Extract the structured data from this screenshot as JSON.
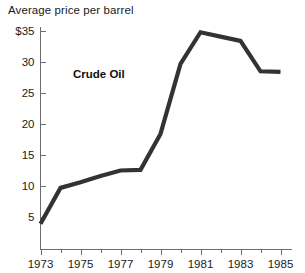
{
  "figure": {
    "title": "Average price per barrel",
    "background_color": "#ffffff"
  },
  "annotation": {
    "label": "Crude Oil",
    "x_px": 73,
    "y_px": 68
  },
  "axes": {
    "y_tick_labels": [
      "$35",
      "30",
      "25",
      "20",
      "15",
      "10",
      "5"
    ],
    "x_tick_labels": [
      "1973",
      "1975",
      "1977",
      "1979",
      "1981",
      "1983",
      "1985"
    ]
  },
  "chart_data": {
    "type": "line",
    "title": "Average price per barrel",
    "xlabel": "",
    "ylabel": "Average price per barrel",
    "series_label": "Crude Oil",
    "line_color": "#333333",
    "grid": false,
    "legend_position": "none",
    "xlim": [
      1973,
      1985
    ],
    "ylim": [
      0,
      36.5
    ],
    "y_ticks": [
      5,
      10,
      15,
      20,
      25,
      30,
      35
    ],
    "y_tick_labels": [
      "5",
      "10",
      "15",
      "20",
      "25",
      "30",
      "$35"
    ],
    "x_ticks": [
      1973,
      1974,
      1975,
      1976,
      1977,
      1978,
      1979,
      1980,
      1981,
      1982,
      1983,
      1984,
      1985
    ],
    "x_major_ticks": [
      1973,
      1975,
      1977,
      1979,
      1981,
      1983,
      1985
    ],
    "x": [
      1973,
      1974,
      1975,
      1976,
      1977,
      1978,
      1979,
      1980,
      1981,
      1982,
      1983,
      1984,
      1985
    ],
    "y": [
      3.9,
      9.7,
      10.6,
      11.6,
      12.5,
      12.6,
      18.4,
      29.7,
      34.8,
      34.1,
      33.4,
      28.5,
      28.4
    ],
    "series": [
      {
        "name": "Crude Oil",
        "values": [
          3.9,
          9.7,
          10.6,
          11.6,
          12.5,
          12.6,
          18.4,
          29.7,
          34.8,
          34.1,
          33.4,
          28.5,
          28.4
        ]
      }
    ]
  }
}
